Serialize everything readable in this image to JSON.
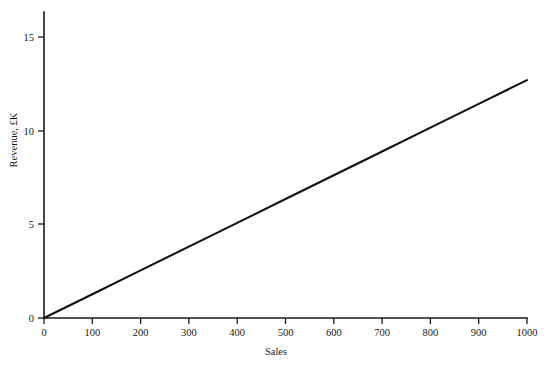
{
  "figure": {
    "background_color": "#ffffff",
    "line_color": "#111111",
    "axis_color": "#1a1a1a"
  },
  "chart_data": {
    "type": "line",
    "title": "",
    "subtitle": "",
    "xlabel": "Sales",
    "ylabel": "Revenue, £K",
    "xlim": [
      0,
      1000
    ],
    "ylim": [
      0,
      16
    ],
    "grid": false,
    "legend": null,
    "legend_position": "none",
    "x_ticks": [
      0,
      100,
      200,
      300,
      400,
      500,
      600,
      700,
      800,
      900,
      1000
    ],
    "x_tick_labels": [
      "0",
      "100",
      "200",
      "300",
      "400",
      "500",
      "600",
      "700",
      "800",
      "900",
      "1000"
    ],
    "y_ticks": [
      0,
      5,
      10,
      15
    ],
    "y_tick_labels": [
      "0",
      "5",
      "10",
      "15"
    ],
    "y_axis_max_drawn": 16.3,
    "annotations": [],
    "series": [
      {
        "name": "Revenue",
        "color": "#111111",
        "slope_per_unit_sale": 0.0127,
        "intercept": 0,
        "x": [
          0,
          100,
          200,
          300,
          400,
          500,
          600,
          700,
          800,
          900,
          1000
        ],
        "values": [
          0,
          1.27,
          2.54,
          3.81,
          5.08,
          6.35,
          7.62,
          8.89,
          10.16,
          11.43,
          12.7
        ]
      }
    ]
  }
}
